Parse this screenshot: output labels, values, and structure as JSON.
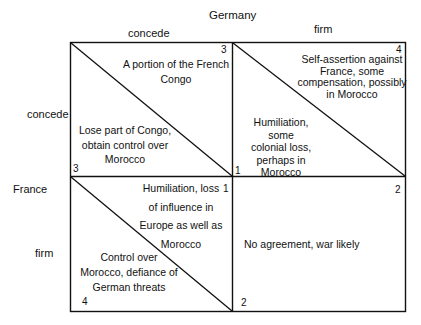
{
  "title": "Germany",
  "column_player": "Germany",
  "row_player": "France",
  "columns": [
    "concede",
    "firm"
  ],
  "rows": [
    "concede",
    "firm"
  ],
  "cells": {
    "cc": {
      "germany_payoff": "3",
      "germany_outcome": "A portion of the French Congo",
      "germany_lines": [
        "A portion of the French",
        "Congo"
      ],
      "france_payoff": "3",
      "france_lines": [
        "Lose part of Congo,",
        "obtain control over",
        "Morocco"
      ]
    },
    "cf": {
      "germany_payoff": "4",
      "germany_lines": [
        "Self-assertion against",
        "France, some",
        "compensation, possibly",
        "in Morocco"
      ],
      "france_payoff": "1",
      "france_lines": [
        "Humiliation, some",
        "colonial loss,",
        "perhaps in",
        "Morocco"
      ]
    },
    "fc": {
      "germany_payoff": "1",
      "germany_lines": [
        "Humiliation, loss",
        "of influence in",
        "Europe as well as",
        "Morocco"
      ],
      "france_payoff": "4",
      "france_lines": [
        "Control over",
        "Morocco, defiance of",
        "German threats"
      ]
    },
    "ff": {
      "germany_payoff": "2",
      "france_payoff": "2",
      "outcome": "No agreement, war likely"
    }
  }
}
